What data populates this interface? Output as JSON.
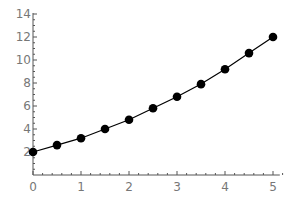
{
  "chart_data": {
    "type": "line",
    "title": "",
    "xlabel": "",
    "ylabel": "",
    "xlim": [
      0,
      5.1
    ],
    "ylim": [
      0,
      14
    ],
    "grid": false,
    "legend": null,
    "x_ticks": [
      0,
      1,
      2,
      3,
      4,
      5
    ],
    "y_ticks": [
      2,
      4,
      6,
      8,
      10,
      12,
      14
    ],
    "x_tick_labels": [
      "0",
      "1",
      "2",
      "3",
      "4",
      "5"
    ],
    "y_tick_labels": [
      "2",
      "4",
      "6",
      "8",
      "10",
      "12",
      "14"
    ],
    "series": [
      {
        "name": "data",
        "markers": true,
        "x": [
          0,
          0.5,
          1,
          1.5,
          2,
          2.5,
          3,
          3.5,
          4,
          4.5,
          5
        ],
        "values": [
          2.0,
          2.6,
          3.2,
          4.0,
          4.8,
          5.8,
          6.8,
          7.9,
          9.2,
          10.6,
          12.0
        ]
      }
    ]
  },
  "colors": {
    "axis": "#555555",
    "tick_label": "#777777",
    "line": "#000000",
    "marker": "#000000"
  }
}
